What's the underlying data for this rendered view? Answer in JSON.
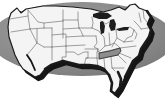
{
  "graphic": {
    "name": "united-states-map",
    "title": "Map of the United States",
    "alt_text": "Outline map of the contiguous United States with state borders; Tennessee is shaded",
    "canvas": {
      "width": 165,
      "height": 110
    }
  },
  "colors": {
    "page_background": "#ffffff",
    "backdrop_ellipse": "#8a8a8a",
    "backdrop_ellipse_shade": "#7c7c7c",
    "land_fill": "#f4f4f4",
    "state_border": "#6e6e6e",
    "country_outline": "#1a1a1a",
    "drop_shadow": "#151515",
    "highlight_fill": "#8d8d8d",
    "highlight_border": "#2a2a2a"
  },
  "backdrop": {
    "label": "gray oval backdrop",
    "shape": "ellipse",
    "cx": 82,
    "cy": 39,
    "rx": 88,
    "ry": 37
  },
  "highlight": {
    "state_label": "Tennessee",
    "state_code": "TN",
    "fill": "#8d8d8d",
    "selected": true
  },
  "legend": {
    "visible": false,
    "entries": []
  },
  "states": [
    {
      "code": "WA",
      "label": "Washington"
    },
    {
      "code": "OR",
      "label": "Oregon"
    },
    {
      "code": "CA",
      "label": "California"
    },
    {
      "code": "ID",
      "label": "Idaho"
    },
    {
      "code": "NV",
      "label": "Nevada"
    },
    {
      "code": "UT",
      "label": "Utah"
    },
    {
      "code": "AZ",
      "label": "Arizona"
    },
    {
      "code": "MT",
      "label": "Montana"
    },
    {
      "code": "WY",
      "label": "Wyoming"
    },
    {
      "code": "CO",
      "label": "Colorado"
    },
    {
      "code": "NM",
      "label": "New Mexico"
    },
    {
      "code": "ND",
      "label": "North Dakota"
    },
    {
      "code": "SD",
      "label": "South Dakota"
    },
    {
      "code": "NE",
      "label": "Nebraska"
    },
    {
      "code": "KS",
      "label": "Kansas"
    },
    {
      "code": "OK",
      "label": "Oklahoma"
    },
    {
      "code": "TX",
      "label": "Texas"
    },
    {
      "code": "MN",
      "label": "Minnesota"
    },
    {
      "code": "IA",
      "label": "Iowa"
    },
    {
      "code": "MO",
      "label": "Missouri"
    },
    {
      "code": "AR",
      "label": "Arkansas"
    },
    {
      "code": "LA",
      "label": "Louisiana"
    },
    {
      "code": "WI",
      "label": "Wisconsin"
    },
    {
      "code": "IL",
      "label": "Illinois"
    },
    {
      "code": "MS",
      "label": "Mississippi"
    },
    {
      "code": "MI",
      "label": "Michigan"
    },
    {
      "code": "IN",
      "label": "Indiana"
    },
    {
      "code": "OH",
      "label": "Ohio"
    },
    {
      "code": "KY",
      "label": "Kentucky"
    },
    {
      "code": "TN",
      "label": "Tennessee"
    },
    {
      "code": "AL",
      "label": "Alabama"
    },
    {
      "code": "GA",
      "label": "Georgia"
    },
    {
      "code": "FL",
      "label": "Florida"
    },
    {
      "code": "SC",
      "label": "South Carolina"
    },
    {
      "code": "NC",
      "label": "North Carolina"
    },
    {
      "code": "VA",
      "label": "Virginia"
    },
    {
      "code": "WV",
      "label": "West Virginia"
    },
    {
      "code": "MD",
      "label": "Maryland"
    },
    {
      "code": "DE",
      "label": "Delaware"
    },
    {
      "code": "PA",
      "label": "Pennsylvania"
    },
    {
      "code": "NJ",
      "label": "New Jersey"
    },
    {
      "code": "NY",
      "label": "New York"
    },
    {
      "code": "CT",
      "label": "Connecticut"
    },
    {
      "code": "RI",
      "label": "Rhode Island"
    },
    {
      "code": "MA",
      "label": "Massachusetts"
    },
    {
      "code": "VT",
      "label": "Vermont"
    },
    {
      "code": "NH",
      "label": "New Hampshire"
    },
    {
      "code": "ME",
      "label": "Maine"
    }
  ]
}
